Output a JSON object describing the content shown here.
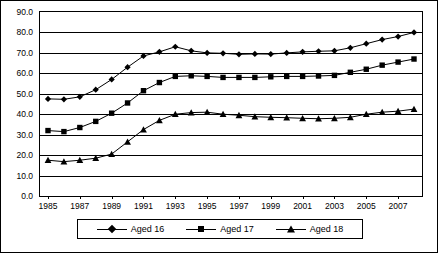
{
  "chart_data": {
    "type": "line",
    "title": "",
    "xlabel": "",
    "ylabel": "",
    "ylim": [
      0,
      90
    ],
    "ytick_labels": [
      "0.0",
      "10.0",
      "20.0",
      "30.0",
      "40.0",
      "50.0",
      "60.0",
      "70.0",
      "80.0",
      "90.0"
    ],
    "ytick_values": [
      0,
      10,
      20,
      30,
      40,
      50,
      60,
      70,
      80,
      90
    ],
    "grid": true,
    "legend_position": "bottom",
    "x": [
      1985,
      1986,
      1987,
      1988,
      1989,
      1990,
      1991,
      1992,
      1993,
      1994,
      1995,
      1996,
      1997,
      1998,
      1999,
      2000,
      2001,
      2002,
      2003,
      2004,
      2005,
      2006,
      2007,
      2008
    ],
    "xtick_labels": [
      "1985",
      "1987",
      "1989",
      "1991",
      "1993",
      "1995",
      "1997",
      "1999",
      "2001",
      "2003",
      "2005",
      "2007"
    ],
    "xtick_values": [
      1985,
      1987,
      1989,
      1991,
      1993,
      1995,
      1997,
      1999,
      2001,
      2003,
      2005,
      2007
    ],
    "series": [
      {
        "name": "Aged 16",
        "marker": "diamond",
        "values": [
          47.5,
          47.3,
          48.5,
          52.0,
          57.0,
          63.0,
          68.5,
          70.5,
          73.0,
          71.0,
          70.0,
          69.8,
          69.3,
          69.5,
          69.4,
          70.0,
          70.5,
          70.8,
          71.0,
          72.5,
          74.5,
          76.5,
          78.0,
          80.0
        ]
      },
      {
        "name": "Aged 17",
        "marker": "square",
        "values": [
          32.0,
          31.5,
          33.5,
          36.5,
          40.5,
          45.5,
          51.5,
          55.5,
          58.5,
          58.8,
          58.5,
          58.0,
          58.0,
          58.0,
          58.3,
          58.5,
          58.5,
          58.7,
          59.0,
          60.5,
          62.0,
          64.0,
          65.5,
          67.0
        ]
      },
      {
        "name": "Aged 18",
        "marker": "triangle",
        "values": [
          17.5,
          16.8,
          17.5,
          18.5,
          20.5,
          26.5,
          32.5,
          37.0,
          40.0,
          40.8,
          41.0,
          40.0,
          39.5,
          38.8,
          38.5,
          38.3,
          38.0,
          37.8,
          38.0,
          38.5,
          40.0,
          41.0,
          41.5,
          42.5
        ]
      }
    ]
  },
  "legend": {
    "items": [
      {
        "label": "Aged 16"
      },
      {
        "label": "Aged 17"
      },
      {
        "label": "Aged 18"
      }
    ]
  }
}
